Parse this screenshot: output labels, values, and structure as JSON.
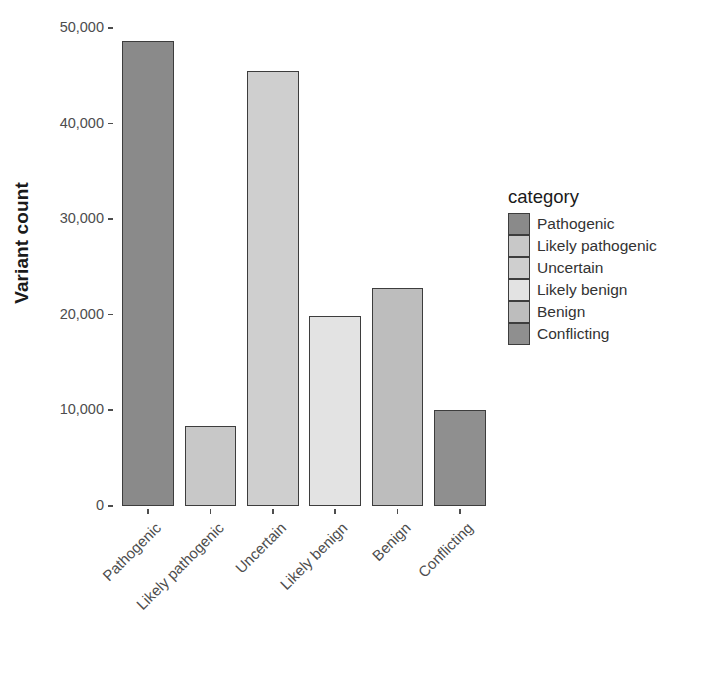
{
  "chart_data": {
    "type": "bar",
    "title": "",
    "xlabel": "",
    "ylabel": "Variant count",
    "categories": [
      "Pathogenic",
      "Likely pathogenic",
      "Uncertain",
      "Likely benign",
      "Benign",
      "Conflicting"
    ],
    "values": [
      48600,
      8400,
      45500,
      19850,
      22800,
      10000
    ],
    "ylim": [
      0,
      50000
    ],
    "y_ticks": [
      0,
      10000,
      20000,
      30000,
      40000,
      50000
    ],
    "y_tick_labels": [
      "0",
      "10,000",
      "20,000",
      "30,000",
      "40,000",
      "50,000"
    ],
    "grid": false,
    "legend_position": "right",
    "legend_title": "category",
    "series": [
      {
        "name": "category",
        "values": [
          48600,
          8400,
          45500,
          19850,
          22800,
          10000
        ]
      }
    ],
    "colors": [
      "#8a8a8a",
      "#c8c8c8",
      "#cfcfcf",
      "#e3e3e3",
      "#bdbdbd",
      "#8f8f8f"
    ]
  },
  "axes": {
    "y_title": "Variant count",
    "y_ticks": [
      {
        "label": "50,000",
        "value": 50000
      },
      {
        "label": "40,000",
        "value": 40000
      },
      {
        "label": "30,000",
        "value": 30000
      },
      {
        "label": "20,000",
        "value": 20000
      },
      {
        "label": "10,000",
        "value": 10000
      },
      {
        "label": "0",
        "value": 0
      }
    ],
    "x_ticks": [
      {
        "label": "Pathogenic"
      },
      {
        "label": "Likely pathogenic"
      },
      {
        "label": "Uncertain"
      },
      {
        "label": "Likely benign"
      },
      {
        "label": "Benign"
      },
      {
        "label": "Conflicting"
      }
    ]
  },
  "legend": {
    "title": "category",
    "items": [
      {
        "label": "Pathogenic",
        "color": "#8a8a8a"
      },
      {
        "label": "Likely pathogenic",
        "color": "#c8c8c8"
      },
      {
        "label": "Uncertain",
        "color": "#cfcfcf"
      },
      {
        "label": "Likely benign",
        "color": "#e3e3e3"
      },
      {
        "label": "Benign",
        "color": "#bdbdbd"
      },
      {
        "label": "Conflicting",
        "color": "#8f8f8f"
      }
    ]
  },
  "style": {
    "background": "#ffffff",
    "axis_text_color": "#4d4d4d",
    "bar_outline": "#3d3d3d"
  }
}
